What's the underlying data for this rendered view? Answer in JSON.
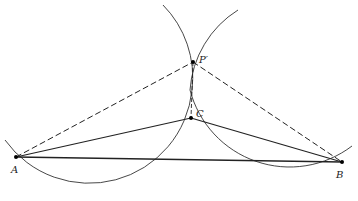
{
  "diagram": {
    "type": "geometric-construction",
    "points": [
      {
        "id": "A",
        "label": "A",
        "x": 16,
        "y": 157
      },
      {
        "id": "B",
        "label": "B",
        "x": 342,
        "y": 162
      },
      {
        "id": "C",
        "label": "C",
        "x": 191,
        "y": 118
      },
      {
        "id": "P",
        "label": "P′",
        "x": 193,
        "y": 62
      }
    ],
    "solid_segments": [
      [
        "A",
        "B"
      ],
      [
        "A",
        "C"
      ],
      [
        "C",
        "B"
      ]
    ],
    "dashed_segments": [
      [
        "A",
        "P"
      ],
      [
        "P",
        "B"
      ],
      [
        "P",
        "C"
      ]
    ],
    "arcs": [
      {
        "name": "arc-through-A",
        "cx": 91.6,
        "cy": 86.4,
        "r": 103.4
      },
      {
        "name": "arc-through-B",
        "cx": 290,
        "cy": 90,
        "r": 103
      }
    ],
    "colors": {
      "line": "#222222",
      "background": "#ffffff"
    }
  }
}
